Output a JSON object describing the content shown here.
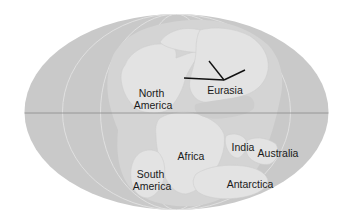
{
  "map": {
    "projection": "elliptical (Mollweide-style) world map",
    "colors": {
      "background": "#ffffff",
      "ocean": "#c9c9c9",
      "land": "#e2e2e2",
      "continental_shelf": "#d6d6d6",
      "grid_lines": "#e8e8e8",
      "equator": "#8a8a8a",
      "boundary_lines": "#111111",
      "label_text": "#1a1a1a"
    },
    "labels": [
      {
        "id": "north-america",
        "lines": [
          "North",
          "America"
        ]
      },
      {
        "id": "eurasia",
        "lines": [
          "Eurasia"
        ]
      },
      {
        "id": "africa",
        "lines": [
          "Africa"
        ]
      },
      {
        "id": "south-america",
        "lines": [
          "South",
          "America"
        ]
      },
      {
        "id": "india",
        "lines": [
          "India"
        ]
      },
      {
        "id": "australia",
        "lines": [
          "Australia"
        ]
      },
      {
        "id": "antarctica",
        "lines": [
          "Antarctica"
        ]
      }
    ]
  }
}
